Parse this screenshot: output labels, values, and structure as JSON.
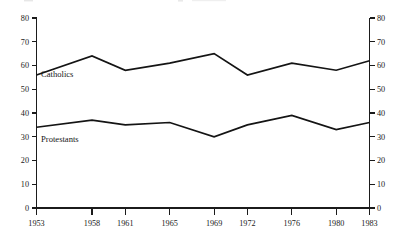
{
  "chart_data": {
    "type": "line",
    "title": "",
    "xlabel": "",
    "ylabel": "",
    "categories": [
      "1953",
      "1958",
      "1961",
      "1965",
      "1969",
      "1972",
      "1976",
      "1980",
      "1983"
    ],
    "x": [
      1953,
      1958,
      1961,
      1965,
      1969,
      1972,
      1976,
      1980,
      1983
    ],
    "series": [
      {
        "name": "Catholics",
        "values": [
          56,
          64,
          58,
          61,
          65,
          56,
          61,
          58,
          62
        ]
      },
      {
        "name": "Protestants",
        "values": [
          34,
          37,
          35,
          36,
          30,
          35,
          39,
          33,
          36
        ]
      }
    ],
    "ylim": [
      0,
      80
    ],
    "yticks": [
      0,
      10,
      20,
      30,
      40,
      50,
      60,
      70,
      80
    ],
    "ytick_labels_left": [
      "0",
      "10",
      "20",
      "30",
      "40",
      "50",
      "60",
      "70",
      "80"
    ],
    "ytick_labels_right": [
      "0",
      "10",
      "20",
      "30",
      "40",
      "50",
      "60",
      "70",
      "80"
    ],
    "grid": false,
    "legend_position": "inline-left",
    "dual_axis": true,
    "line_color": "#141414",
    "axis_color": "#1b1b1b"
  },
  "annotations": {
    "catholics_label": "Catholics",
    "protestants_label": "Protestants"
  }
}
